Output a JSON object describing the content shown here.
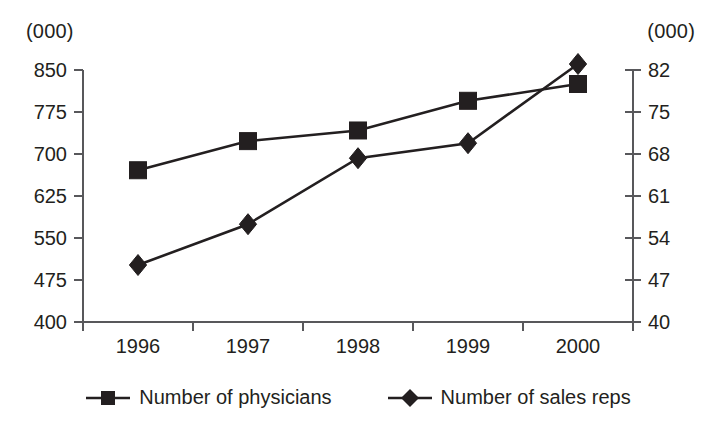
{
  "chart_data": {
    "type": "line",
    "title": "",
    "subtitle": "",
    "xlabel": "",
    "ylabel": "",
    "grid": false,
    "legend_position": "bottom",
    "categories": [
      "1996",
      "1997",
      "1998",
      "1999",
      "2000"
    ],
    "left_axis": {
      "unit_label": "(000)",
      "ticks": [
        "850",
        "775",
        "700",
        "625",
        "550",
        "475",
        "400"
      ],
      "tick_values": [
        850,
        775,
        700,
        625,
        550,
        475,
        400
      ],
      "ylim": [
        400,
        850
      ],
      "step": 75
    },
    "right_axis": {
      "unit_label": "(000)",
      "ticks": [
        "82",
        "75",
        "68",
        "61",
        "54",
        "47",
        "40"
      ],
      "tick_values": [
        82,
        75,
        68,
        61,
        54,
        47,
        40
      ],
      "ylim": [
        40,
        82
      ],
      "step": 7
    },
    "series": [
      {
        "name": "Number of physicians",
        "marker": "square",
        "axis": "left",
        "values": [
          671,
          723,
          742,
          795,
          825
        ]
      },
      {
        "name": "Number of sales reps",
        "marker": "diamond",
        "axis": "right",
        "values": [
          49.5,
          56.3,
          67.3,
          69.8,
          83
        ]
      }
    ],
    "colors": {
      "series_line": "#231f20",
      "marker": "#231f20",
      "axis": "#58585b",
      "text": "#231f20",
      "background": "#ffffff"
    }
  },
  "legend": {
    "items": [
      {
        "label": "Number of physicians",
        "marker": "square-marker-icon"
      },
      {
        "label": "Number of sales reps",
        "marker": "diamond-marker-icon"
      }
    ]
  }
}
